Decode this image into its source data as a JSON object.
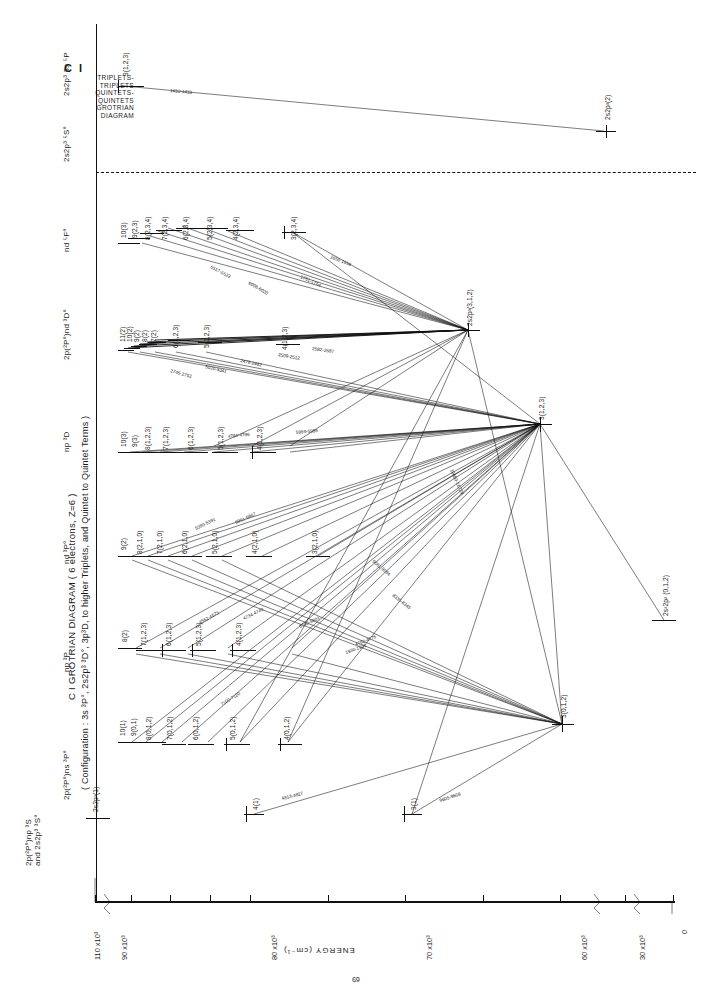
{
  "masthead": {
    "title": "C I",
    "lines": [
      "TRIPLETS-",
      "TRIPLETS",
      "QUINTETS-",
      "QUINTETS",
      "GROTRIAN",
      "DIAGRAM"
    ]
  },
  "header": {
    "main_title": "C I GROTRIAN DIAGRAM ( 6 electrons, Z=6 )",
    "configuration": "( Configuration :  3s ³P°,  2s2p³ ³D°,  3p³D, to higher  Triplets, and  Quintet to Quintet  Terms )"
  },
  "axis": {
    "title": "ENERGY  (cm⁻¹)",
    "ticks": [
      {
        "label": "110 x10³",
        "value": 110000
      },
      {
        "label": "90 x10³",
        "value": 90000
      },
      {
        "label": "80 x10³",
        "value": 80000
      },
      {
        "label": "70 x10³",
        "value": 70000
      },
      {
        "label": "60 x10³",
        "value": 60000
      },
      {
        "label": "30 x10³",
        "value": 30000
      },
      {
        "label": "0",
        "value": 0
      }
    ],
    "break_marks": 3
  },
  "page_number": "69",
  "columns": [
    {
      "id": "col-2p2P0ns3S",
      "label": "2p(²P°)np ³S",
      "sublabel": "and 2s2p³ ³S°"
    },
    {
      "id": "col-2p2P0ns3P0",
      "label": "2p(²P°)ns ³P°"
    },
    {
      "id": "col-np3P",
      "label": "np ³P"
    },
    {
      "id": "col-nd3P0",
      "label": "nd ³P°"
    },
    {
      "id": "col-np3D",
      "label": "np ³D"
    },
    {
      "id": "col-2p2P0nd3D0",
      "label": "2p(²P°)nd ³D°"
    },
    {
      "id": "col-nd5F0",
      "label": "nd ⁵F°"
    },
    {
      "id": "col-2s2p35S0",
      "label": "2s2p³ ⁵S°"
    },
    {
      "id": "col-2s2p33s5P",
      "label": "2s2p³ 3s ⁵P"
    }
  ],
  "series": {
    "nd5F0": {
      "name": "nd ⁵F°",
      "levels": [
        "10(3)",
        "9(2,3)",
        "8(2,3,4)",
        "7(2,3,4)",
        "6(2,3,4)",
        "5(2,3,4)",
        "4(2,3,4)",
        "3(2,3,4)"
      ]
    },
    "nd3D0": {
      "name": "2p(²P°)nd ³D°",
      "levels": [
        "11(2)",
        "10(2)",
        "9(2)",
        "8(2)",
        "7(2)",
        "6(1,2,3)",
        "5(1,2,3)",
        "4(1,2,3)",
        "3(1,2,3)"
      ]
    },
    "np3D": {
      "name": "np ³D",
      "levels": [
        "10(3)",
        "9(3)",
        "8(1,2,3)",
        "7(1,2,3)",
        "6(1,2,3)",
        "5(1,2,3)",
        "4(1,2,3)",
        "3(1,2,3)"
      ]
    },
    "nd3P0": {
      "name": "nd ³P°",
      "levels": [
        "9(2)",
        "8(2,1,0)",
        "7(2,1,0)",
        "6(2,1,0)",
        "5(2,1,0)",
        "4(2,1,0)",
        "3(2,1,0)"
      ]
    },
    "np3P": {
      "name": "np ³P",
      "levels": [
        "8(2)",
        "7(1,2,3)",
        "6(1,2,3)",
        "5(1,2,3)",
        "4(1,2,3)"
      ]
    },
    "ns3P0": {
      "name": "2p(²P°)ns ³P°",
      "levels": [
        "10(1)",
        "9(0,1)",
        "8(0,1,2)",
        "7(0,1,2)",
        "6(0,1,2)",
        "5(0,1,2)",
        "4(0,1,2)",
        "3(0,1,2)"
      ]
    },
    "ng3S": {
      "name": "2p(²P°)np ³S",
      "levels": [
        "2s2p³(1)",
        "4(1)",
        "3(1)"
      ]
    },
    "quintet": {
      "name": "quintet terms",
      "levels": [
        "3(1,2,3)",
        "2s2p³(2)",
        "2s2p³(3,1,2)",
        "2s²2p²(0,1,2)"
      ]
    }
  },
  "key_levels": [
    {
      "name": "level-2s2p3-3s-5P",
      "label": "3(1,2,3)",
      "column": "2s2p³ 3s ⁵P"
    },
    {
      "name": "level-2s2p3-5S0",
      "label": "2s2p³(2)",
      "column": "2s2p³ ⁵S°"
    },
    {
      "name": "level-hub-3D0",
      "label": "2s2p³(3,1,2)",
      "column": "2p(²P°)nd ³D°"
    },
    {
      "name": "level-hub-np3D",
      "label": "3(1,2,3)",
      "column": "np ³D"
    },
    {
      "name": "level-hub-ground",
      "label": "3(0,1,2)",
      "column": "2p(²P°)ns ³P°"
    },
    {
      "name": "level-ground-state",
      "label": "2s²2p² (0,1,2)",
      "column": "ground"
    }
  ],
  "wavelengths": [
    "1432-1433",
    "1560-1561",
    "1656-1658",
    "1751-1754",
    "1930-1931",
    "2478-2482",
    "2509-2512",
    "2582-2587",
    "2746-2752",
    "2905-2908",
    "3876-3880",
    "4228-4232",
    "4267-4272",
    "4371-4375",
    "4478-4483",
    "4562-4573",
    "4734-4743",
    "4762-4776",
    "4784-4796",
    "4813-4827",
    "4932-4941",
    "5020-5041",
    "5052-5057",
    "5380-5391",
    "5517-5523",
    "5793-5801",
    "5800-5806",
    "5961-5967",
    "5969-5989",
    "6006-6020",
    "6587-6596",
    "7100-7120",
    "8335-8345",
    "9061-9094",
    "9405-9409",
    "9605-9608",
    "9658-9663",
    "10683-10729"
  ],
  "colors": {
    "ink": "#111111",
    "paper": "#ffffff"
  }
}
